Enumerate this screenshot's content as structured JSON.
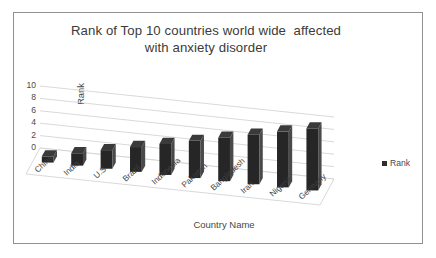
{
  "chart_data": {
    "type": "bar",
    "title": "Rank of Top 10 countries world wide  affected\nwith anxiety disorder",
    "xlabel": "Country Name",
    "ylabel": "Rank",
    "categories": [
      "China",
      "India",
      "U.S",
      "Brazil",
      "Indonesia",
      "Pakistan",
      "Bangladesh",
      "Iran",
      "Nigeria",
      "Germany"
    ],
    "values": [
      1,
      2,
      3,
      4,
      5,
      6,
      7,
      8,
      9,
      10
    ],
    "series": [
      {
        "name": "Rank",
        "values": [
          1,
          2,
          3,
          4,
          5,
          6,
          7,
          8,
          9,
          10
        ]
      }
    ],
    "ylim": [
      0,
      10
    ],
    "yticks": [
      "0",
      "2",
      "4",
      "6",
      "8",
      "10"
    ],
    "grid": true,
    "legend_position": "right",
    "legend_entries": [
      "Rank"
    ],
    "bar_color": "#262626",
    "style": "3d-column"
  },
  "legend": {
    "swatch_name": "rank-series-swatch",
    "label": "Rank"
  },
  "frame": {
    "border_color": "#8f9193",
    "background": "#ffffff"
  }
}
